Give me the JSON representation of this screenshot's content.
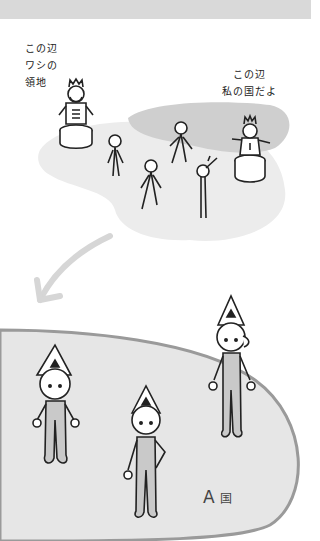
{
  "scene": {
    "header_band_color": "#d9d9d9",
    "territory_color": "#d0d0d0",
    "country_fill_color": "#e6e6e6",
    "country_border_color": "#9a9a9a",
    "arrow_color": "#d6d6d6"
  },
  "speech": {
    "left_king": "この辺\nワシの\n領地",
    "right_king": "この辺\n私の国だよ"
  },
  "country": {
    "letter": "A",
    "kanji": "国"
  }
}
